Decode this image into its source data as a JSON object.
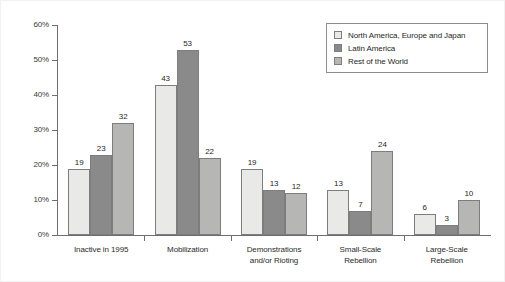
{
  "chart_data": {
    "type": "bar",
    "title": "",
    "subtitle": "",
    "xlabel": "",
    "ylabel": "",
    "ylim": [
      0,
      60
    ],
    "ytick_labels": [
      "0%",
      "10%",
      "20%",
      "30%",
      "40%",
      "50%",
      "60%"
    ],
    "ytick_values": [
      0,
      10,
      20,
      30,
      40,
      50,
      60
    ],
    "grid": false,
    "legend_position": "top-right",
    "categories": [
      "Inactive in 1995",
      "Mobilization",
      "Demonstrations and/or Rioting",
      "Small-Scale Rebellion",
      "Large-Scale Rebellion"
    ],
    "category_lines": [
      [
        "Inactive in 1995"
      ],
      [
        "Mobilization"
      ],
      [
        "Demonstrations",
        "and/or Rioting"
      ],
      [
        "Small-Scale",
        "Rebellion"
      ],
      [
        "Large-Scale",
        "Rebellion"
      ]
    ],
    "series": [
      {
        "name": "North America, Europe and Japan",
        "color": "#e9e9e7",
        "values": [
          19,
          43,
          19,
          13,
          6
        ]
      },
      {
        "name": "Latin America",
        "color": "#8a8a8a",
        "values": [
          23,
          53,
          13,
          7,
          3
        ]
      },
      {
        "name": "Rest of the World",
        "color": "#b6b6b4",
        "values": [
          32,
          22,
          12,
          24,
          10
        ]
      }
    ]
  },
  "legend": {
    "items": [
      {
        "label": "North America, Europe and Japan",
        "swatch": "legend-swatch-light"
      },
      {
        "label": "Latin America",
        "swatch": "legend-swatch-dark"
      },
      {
        "label": "Rest of the World",
        "swatch": "legend-swatch-medium"
      }
    ]
  },
  "colors": {
    "series_light": "#e9e9e7",
    "series_dark": "#8a8a8a",
    "series_medium": "#b6b6b4",
    "axis": "#6e6e6e",
    "bar_outline": "#7d7d7d",
    "text": "#1f1f1f",
    "background": "#ffffff"
  }
}
